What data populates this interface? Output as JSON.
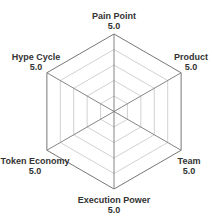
{
  "chart_data": {
    "type": "radar",
    "title": "",
    "axes": [
      "Pain Point",
      "Product",
      "Team",
      "Execution Power",
      "Token Economy",
      "Hype Cycle"
    ],
    "values": [
      5.0,
      5.0,
      5.0,
      5.0,
      5.0,
      5.0
    ],
    "value_labels": [
      "5.0",
      "5.0",
      "5.0",
      "5.0",
      "5.0",
      "5.0"
    ],
    "rings": 5,
    "range": [
      0,
      5
    ],
    "grid": true,
    "legend": "none"
  },
  "labels": [
    {
      "name": "Pain Point",
      "value": "5.0"
    },
    {
      "name": "Product",
      "value": "5.0"
    },
    {
      "name": "Team",
      "value": "5.0"
    },
    {
      "name": "Execution Power",
      "value": "5.0"
    },
    {
      "name": "Token Economy",
      "value": "5.0"
    },
    {
      "name": "Hype Cycle",
      "value": "5.0"
    }
  ],
  "colors": {
    "outer_ring": "#777777",
    "inner_ring": "#cccccc",
    "spoke": "#777777",
    "label": "#333333"
  }
}
